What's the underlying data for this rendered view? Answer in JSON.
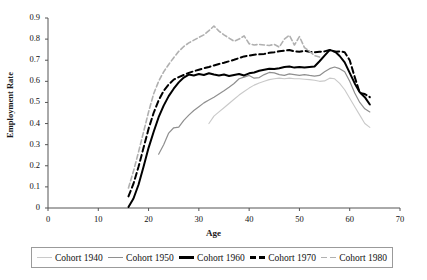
{
  "chart_data": {
    "type": "line",
    "title": "",
    "xlabel": "Age",
    "ylabel": "Employment Rate",
    "xlim": [
      0,
      70
    ],
    "ylim": [
      0,
      0.9
    ],
    "xticks": [
      0,
      10,
      20,
      30,
      40,
      50,
      60,
      70
    ],
    "yticks": [
      0,
      0.1,
      0.2,
      0.3,
      0.4,
      0.5,
      0.6,
      0.7,
      0.8,
      0.9
    ],
    "xtick_labels": [
      "0",
      "10",
      "20",
      "30",
      "40",
      "50",
      "60",
      "70"
    ],
    "ytick_labels": [
      "0",
      "0.1",
      "0.2",
      "0.3",
      "0.4",
      "0.5",
      "0.6",
      "0.7",
      "0.8",
      "0.9"
    ],
    "grid": false,
    "legend_position": "bottom",
    "series": [
      {
        "name": "Cohort 1940",
        "color": "#c9c9c9",
        "dash": "solid",
        "width": 1.1,
        "x": [
          32,
          33,
          34,
          35,
          36,
          37,
          38,
          39,
          40,
          41,
          42,
          43,
          44,
          45,
          46,
          47,
          48,
          49,
          50,
          51,
          52,
          53,
          54,
          55,
          56,
          57,
          58,
          59,
          60,
          61,
          62,
          63,
          64
        ],
        "y": [
          0.4,
          0.435,
          0.455,
          0.475,
          0.495,
          0.515,
          0.535,
          0.552,
          0.568,
          0.582,
          0.592,
          0.6,
          0.608,
          0.612,
          0.615,
          0.612,
          0.615,
          0.612,
          0.612,
          0.61,
          0.608,
          0.605,
          0.6,
          0.602,
          0.615,
          0.612,
          0.59,
          0.56,
          0.52,
          0.48,
          0.44,
          0.4,
          0.382
        ]
      },
      {
        "name": "Cohort 1950",
        "color": "#8f8f8f",
        "dash": "solid",
        "width": 1.2,
        "x": [
          22,
          23,
          24,
          25,
          26,
          27,
          28,
          29,
          30,
          31,
          32,
          33,
          34,
          35,
          36,
          37,
          38,
          39,
          40,
          41,
          42,
          43,
          44,
          45,
          46,
          47,
          48,
          49,
          50,
          51,
          52,
          53,
          54,
          55,
          56,
          57,
          58,
          59,
          60,
          61,
          62,
          63,
          64
        ],
        "y": [
          0.255,
          0.3,
          0.355,
          0.38,
          0.383,
          0.415,
          0.44,
          0.462,
          0.48,
          0.498,
          0.512,
          0.525,
          0.54,
          0.555,
          0.572,
          0.59,
          0.612,
          0.62,
          0.628,
          0.615,
          0.618,
          0.632,
          0.642,
          0.64,
          0.632,
          0.628,
          0.635,
          0.632,
          0.628,
          0.632,
          0.628,
          0.625,
          0.628,
          0.645,
          0.66,
          0.668,
          0.66,
          0.645,
          0.6,
          0.545,
          0.5,
          0.47,
          0.455
        ]
      },
      {
        "name": "Cohort 1960",
        "color": "#000000",
        "dash": "solid",
        "width": 2.0,
        "x": [
          16,
          17,
          18,
          19,
          20,
          21,
          22,
          23,
          24,
          25,
          26,
          27,
          28,
          29,
          30,
          31,
          32,
          33,
          34,
          35,
          36,
          37,
          38,
          39,
          40,
          41,
          42,
          43,
          44,
          45,
          46,
          47,
          48,
          49,
          50,
          51,
          52,
          53,
          54,
          55,
          56,
          57,
          58,
          59,
          60,
          61,
          62,
          63,
          64
        ],
        "y": [
          0.005,
          0.045,
          0.11,
          0.195,
          0.285,
          0.36,
          0.43,
          0.485,
          0.53,
          0.565,
          0.595,
          0.618,
          0.632,
          0.628,
          0.635,
          0.63,
          0.638,
          0.632,
          0.628,
          0.632,
          0.625,
          0.63,
          0.635,
          0.628,
          0.638,
          0.642,
          0.65,
          0.655,
          0.66,
          0.658,
          0.662,
          0.668,
          0.67,
          0.665,
          0.668,
          0.665,
          0.668,
          0.67,
          0.695,
          0.722,
          0.748,
          0.742,
          0.72,
          0.69,
          0.64,
          0.59,
          0.548,
          0.525,
          0.49
        ]
      },
      {
        "name": "Cohort 1970",
        "color": "#000000",
        "dash": "dashed",
        "width": 2.0,
        "x": [
          16,
          17,
          18,
          19,
          20,
          21,
          22,
          23,
          24,
          25,
          26,
          27,
          28,
          29,
          30,
          31,
          32,
          33,
          34,
          35,
          36,
          37,
          38,
          39,
          40,
          41,
          42,
          43,
          44,
          45,
          46,
          47,
          48,
          49,
          50,
          51,
          52,
          53,
          54,
          55,
          56,
          57,
          58,
          59,
          60,
          61,
          62,
          63,
          64
        ],
        "y": [
          0.055,
          0.115,
          0.195,
          0.285,
          0.375,
          0.45,
          0.51,
          0.555,
          0.585,
          0.608,
          0.62,
          0.63,
          0.64,
          0.648,
          0.655,
          0.662,
          0.668,
          0.675,
          0.682,
          0.688,
          0.695,
          0.702,
          0.71,
          0.718,
          0.722,
          0.726,
          0.728,
          0.73,
          0.735,
          0.738,
          0.742,
          0.745,
          0.748,
          0.742,
          0.74,
          0.745,
          0.74,
          0.738,
          0.74,
          0.742,
          0.748,
          0.74,
          0.742,
          0.738,
          0.7,
          0.62,
          0.545,
          0.54,
          0.525
        ]
      },
      {
        "name": "Cohort 1980",
        "color": "#b0b0b0",
        "dash": "dashed",
        "width": 1.6,
        "x": [
          16,
          17,
          18,
          19,
          20,
          21,
          22,
          23,
          24,
          25,
          26,
          27,
          28,
          29,
          30,
          31,
          32,
          33,
          34,
          35,
          36,
          37,
          38,
          39,
          40,
          41,
          42,
          43,
          44,
          45,
          46,
          47,
          48,
          49,
          50,
          51,
          52,
          53,
          54
        ],
        "y": [
          0.095,
          0.175,
          0.265,
          0.36,
          0.455,
          0.54,
          0.6,
          0.645,
          0.68,
          0.712,
          0.742,
          0.765,
          0.782,
          0.795,
          0.808,
          0.82,
          0.84,
          0.862,
          0.838,
          0.82,
          0.805,
          0.79,
          0.8,
          0.815,
          0.778,
          0.772,
          0.775,
          0.772,
          0.77,
          0.775,
          0.762,
          0.8,
          0.818,
          0.772,
          0.812,
          0.76,
          0.742,
          0.722,
          0.715
        ]
      }
    ]
  },
  "legend": {
    "items": [
      {
        "label": "Cohort 1940",
        "color": "#c9c9c9",
        "dash": "solid"
      },
      {
        "label": "Cohort 1950",
        "color": "#8f8f8f",
        "dash": "solid"
      },
      {
        "label": "Cohort 1960",
        "color": "#000000",
        "dash": "solid"
      },
      {
        "label": "Cohort 1970",
        "color": "#000000",
        "dash": "dashed"
      },
      {
        "label": "Cohort 1980",
        "color": "#b0b0b0",
        "dash": "dashed"
      }
    ]
  },
  "axes": {
    "x_title": "Age",
    "y_title": "Employment Rate",
    "axis_color": "#555555"
  }
}
